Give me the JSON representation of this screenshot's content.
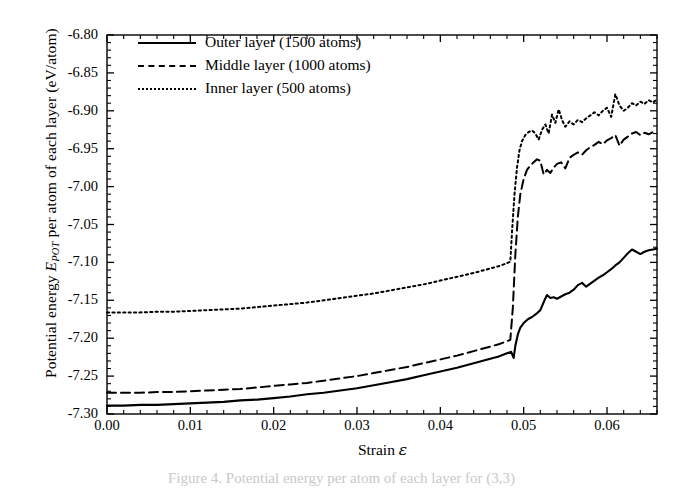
{
  "figure": {
    "caption_fragment": "Figure 4. Potential energy per atom of each layer for (3,3)"
  },
  "chart_data": {
    "type": "line",
    "title": "",
    "xlabel": "Strain ε",
    "xlabel_plain": "Strain",
    "xlabel_symbol": "ε",
    "ylabel": "Potential energy E_POT per atom of each layer (eV/atom)",
    "ylabel_prefix": "Potential energy ",
    "ylabel_symbol": "E",
    "ylabel_subscript": "POT",
    "ylabel_suffix": " per atom of each layer (eV/atom)",
    "xlim": [
      0.0,
      0.066
    ],
    "ylim": [
      -7.3,
      -6.8
    ],
    "xticks": [
      0.0,
      0.01,
      0.02,
      0.03,
      0.04,
      0.05,
      0.06
    ],
    "xtick_labels": [
      "0.00",
      "0.01",
      "0.02",
      "0.03",
      "0.04",
      "0.05",
      "0.06"
    ],
    "yticks": [
      -6.8,
      -6.85,
      -6.9,
      -6.95,
      -7.0,
      -7.05,
      -7.1,
      -7.15,
      -7.2,
      -7.25,
      -7.3
    ],
    "ytick_labels": [
      "-6.80",
      "-6.85",
      "-6.90",
      "-6.95",
      "-7.00",
      "-7.05",
      "-7.10",
      "-7.15",
      "-7.20",
      "-7.25",
      "-7.30"
    ],
    "minor_ticks_per_interval": 5,
    "grid": false,
    "legend_position": "upper left",
    "frame": true,
    "tick_direction": "in",
    "line_color": "#000000",
    "series": [
      {
        "name": "Outer layer (1500 atoms)",
        "label": "Outer layer (1500 atoms)",
        "style": "solid",
        "atoms": 1500,
        "x": [
          0.0,
          0.002,
          0.004,
          0.006,
          0.008,
          0.01,
          0.012,
          0.014,
          0.016,
          0.018,
          0.02,
          0.022,
          0.024,
          0.026,
          0.028,
          0.03,
          0.032,
          0.034,
          0.036,
          0.038,
          0.04,
          0.042,
          0.044,
          0.046,
          0.047,
          0.048,
          0.0485,
          0.0488,
          0.049,
          0.0493,
          0.0496,
          0.05,
          0.0505,
          0.051,
          0.0515,
          0.052,
          0.0525,
          0.0528,
          0.0532,
          0.0536,
          0.054,
          0.0545,
          0.055,
          0.0555,
          0.056,
          0.0565,
          0.057,
          0.0575,
          0.058,
          0.0585,
          0.059,
          0.0595,
          0.06,
          0.0605,
          0.061,
          0.0615,
          0.062,
          0.0625,
          0.063,
          0.0635,
          0.064,
          0.0645,
          0.065,
          0.0655,
          0.066
        ],
        "y": [
          -7.289,
          -7.289,
          -7.288,
          -7.288,
          -7.287,
          -7.286,
          -7.285,
          -7.284,
          -7.282,
          -7.281,
          -7.279,
          -7.277,
          -7.274,
          -7.272,
          -7.269,
          -7.266,
          -7.262,
          -7.258,
          -7.254,
          -7.249,
          -7.244,
          -7.239,
          -7.233,
          -7.227,
          -7.224,
          -7.22,
          -7.218,
          -7.226,
          -7.21,
          -7.195,
          -7.186,
          -7.18,
          -7.175,
          -7.172,
          -7.168,
          -7.163,
          -7.15,
          -7.143,
          -7.147,
          -7.146,
          -7.148,
          -7.145,
          -7.142,
          -7.14,
          -7.136,
          -7.13,
          -7.127,
          -7.132,
          -7.128,
          -7.124,
          -7.12,
          -7.117,
          -7.113,
          -7.109,
          -7.104,
          -7.1,
          -7.094,
          -7.088,
          -7.083,
          -7.086,
          -7.089,
          -7.086,
          -7.084,
          -7.083,
          -7.082
        ]
      },
      {
        "name": "Middle layer (1000 atoms)",
        "label": "Middle layer (1000 atoms)",
        "style": "dashed",
        "atoms": 1000,
        "x": [
          0.0,
          0.002,
          0.004,
          0.006,
          0.008,
          0.01,
          0.012,
          0.014,
          0.016,
          0.018,
          0.02,
          0.022,
          0.024,
          0.026,
          0.028,
          0.03,
          0.032,
          0.034,
          0.036,
          0.038,
          0.04,
          0.042,
          0.044,
          0.046,
          0.047,
          0.048,
          0.0484,
          0.0487,
          0.049,
          0.0493,
          0.0496,
          0.05,
          0.0504,
          0.0508,
          0.0512,
          0.0516,
          0.052,
          0.0524,
          0.0528,
          0.0532,
          0.0536,
          0.054,
          0.0545,
          0.055,
          0.0555,
          0.056,
          0.0565,
          0.057,
          0.0575,
          0.058,
          0.0585,
          0.059,
          0.0595,
          0.06,
          0.0605,
          0.061,
          0.0615,
          0.062,
          0.0625,
          0.063,
          0.0635,
          0.064,
          0.0645,
          0.065,
          0.0655,
          0.066
        ],
        "y": [
          -7.272,
          -7.272,
          -7.272,
          -7.271,
          -7.271,
          -7.27,
          -7.269,
          -7.268,
          -7.267,
          -7.265,
          -7.263,
          -7.261,
          -7.259,
          -7.256,
          -7.253,
          -7.25,
          -7.246,
          -7.242,
          -7.238,
          -7.233,
          -7.228,
          -7.223,
          -7.217,
          -7.211,
          -7.208,
          -7.204,
          -7.202,
          -7.16,
          -7.09,
          -7.04,
          -7.01,
          -6.99,
          -6.978,
          -6.972,
          -6.968,
          -6.964,
          -6.966,
          -6.984,
          -6.978,
          -6.982,
          -6.975,
          -6.97,
          -6.968,
          -6.976,
          -6.962,
          -6.958,
          -6.955,
          -6.958,
          -6.952,
          -6.948,
          -6.945,
          -6.941,
          -6.944,
          -6.939,
          -6.936,
          -6.932,
          -6.946,
          -6.938,
          -6.934,
          -6.93,
          -6.928,
          -6.932,
          -6.929,
          -6.931,
          -6.928,
          -6.93
        ]
      },
      {
        "name": "Inner layer (500 atoms)",
        "label": "Inner layer (500 atoms)",
        "style": "dotted",
        "atoms": 500,
        "x": [
          0.0,
          0.002,
          0.004,
          0.006,
          0.008,
          0.01,
          0.012,
          0.014,
          0.016,
          0.018,
          0.02,
          0.022,
          0.024,
          0.026,
          0.028,
          0.03,
          0.032,
          0.034,
          0.036,
          0.038,
          0.04,
          0.042,
          0.044,
          0.046,
          0.047,
          0.048,
          0.0484,
          0.0486,
          0.0489,
          0.0492,
          0.0495,
          0.0498,
          0.0502,
          0.0506,
          0.051,
          0.0514,
          0.0518,
          0.0522,
          0.0526,
          0.053,
          0.0534,
          0.0538,
          0.0542,
          0.0546,
          0.055,
          0.0555,
          0.056,
          0.0565,
          0.057,
          0.0575,
          0.058,
          0.0585,
          0.059,
          0.0595,
          0.06,
          0.0605,
          0.061,
          0.0615,
          0.062,
          0.0625,
          0.063,
          0.0635,
          0.064,
          0.0645,
          0.065,
          0.0655,
          0.066
        ],
        "y": [
          -7.166,
          -7.166,
          -7.166,
          -7.165,
          -7.165,
          -7.164,
          -7.163,
          -7.162,
          -7.161,
          -7.159,
          -7.157,
          -7.155,
          -7.153,
          -7.15,
          -7.147,
          -7.144,
          -7.141,
          -7.137,
          -7.133,
          -7.129,
          -7.124,
          -7.119,
          -7.114,
          -7.108,
          -7.105,
          -7.101,
          -7.099,
          -7.06,
          -7.01,
          -6.975,
          -6.952,
          -6.94,
          -6.932,
          -6.928,
          -6.926,
          -6.93,
          -6.938,
          -6.925,
          -6.918,
          -6.93,
          -6.905,
          -6.916,
          -6.898,
          -6.912,
          -6.921,
          -6.914,
          -6.918,
          -6.912,
          -6.915,
          -6.91,
          -6.906,
          -6.902,
          -6.906,
          -6.9,
          -6.896,
          -6.908,
          -6.878,
          -6.893,
          -6.9,
          -6.896,
          -6.89,
          -6.893,
          -6.888,
          -6.891,
          -6.886,
          -6.889,
          -6.885
        ]
      }
    ]
  }
}
